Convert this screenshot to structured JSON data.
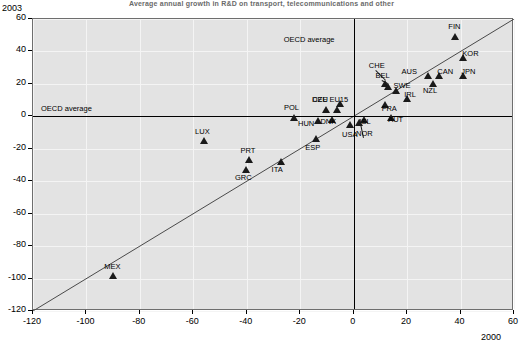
{
  "title": "Average annual growth in R&D on transport, telecommunications and other",
  "axes": {
    "y_corner_label": "2003",
    "x_corner_label": "2000",
    "xlim": [
      -120,
      60
    ],
    "ylim": [
      -120,
      60
    ],
    "xticks": [
      -120,
      -100,
      -80,
      -60,
      -40,
      -20,
      0,
      20,
      40,
      60
    ],
    "yticks": [
      -120,
      -100,
      -80,
      -60,
      -40,
      -20,
      0,
      20,
      40,
      60
    ],
    "grid": true
  },
  "annotations": {
    "oecd_average_horizontal": "OECD average",
    "oecd_average_vertical": "OECD average"
  },
  "chart_data": {
    "type": "scatter",
    "title": "Average annual growth in R&D on transport, telecommunications and other",
    "xlabel": "2000",
    "ylabel": "2003",
    "xlim": [
      -120,
      60
    ],
    "ylim": [
      -120,
      60
    ],
    "grid": true,
    "legend": "none",
    "reference_lines": [
      {
        "name": "diagonal",
        "type": "identity",
        "from": [
          -120,
          -120
        ],
        "to": [
          60,
          60
        ]
      },
      {
        "name": "oecd-average-x",
        "type": "vertical",
        "value": 0
      },
      {
        "name": "oecd-average-y",
        "type": "horizontal",
        "value": 0
      }
    ],
    "points": [
      {
        "label": "FIN",
        "x": 38,
        "y": 47,
        "label_dx": 0,
        "label_dy": -10,
        "leader": false
      },
      {
        "label": "KOR",
        "x": 41,
        "y": 34,
        "label_dx": 6,
        "label_dy": -4,
        "leader": false
      },
      {
        "label": "AUS",
        "x": 28,
        "y": 23,
        "label_dx": -20,
        "label_dy": -4,
        "leader": false
      },
      {
        "label": "CAN",
        "x": 32,
        "y": 23,
        "label_dx": 5,
        "label_dy": -4,
        "leader": false
      },
      {
        "label": "JPN",
        "x": 41,
        "y": 23,
        "label_dx": 5,
        "label_dy": -4,
        "leader": false
      },
      {
        "label": "NZL",
        "x": 30,
        "y": 18,
        "label_dx": -4,
        "label_dy": 7,
        "leader": false
      },
      {
        "label": "CHE",
        "x": 12,
        "y": 18,
        "label_dx": -10,
        "label_dy": -18,
        "leader": true
      },
      {
        "label": "BEL",
        "x": 13,
        "y": 16,
        "label_dx": -6,
        "label_dy": -11,
        "leader": true
      },
      {
        "label": "SWE",
        "x": 16,
        "y": 14,
        "label_dx": 4,
        "label_dy": -5,
        "leader": false
      },
      {
        "label": "IRL",
        "x": 20,
        "y": 9,
        "label_dx": 4,
        "label_dy": -4,
        "leader": false
      },
      {
        "label": "FRA",
        "x": 12,
        "y": 5,
        "label_dx": 3,
        "label_dy": 4,
        "leader": false
      },
      {
        "label": "CZE",
        "x": -5,
        "y": 6,
        "label_dx": -21,
        "label_dy": -4,
        "leader": false
      },
      {
        "label": "DEU",
        "x": -10,
        "y": 2,
        "label_dx": -8,
        "label_dy": -10,
        "leader": false
      },
      {
        "label": "EU15",
        "x": -6,
        "y": 2,
        "label_dx": 1,
        "label_dy": -10,
        "leader": false
      },
      {
        "label": "POL",
        "x": -22,
        "y": -3,
        "label_dx": -4,
        "label_dy": -10,
        "leader": false
      },
      {
        "label": "HUN",
        "x": -13,
        "y": -5,
        "label_dx": -14,
        "label_dy": 3,
        "leader": false
      },
      {
        "label": "DNK",
        "x": -8,
        "y": -4,
        "label_dx": -5,
        "label_dy": 2,
        "leader": false
      },
      {
        "label": "ISL",
        "x": 4,
        "y": -4,
        "label_dx": 2,
        "label_dy": 2,
        "leader": false
      },
      {
        "label": "AUT",
        "x": 14,
        "y": -3,
        "label_dx": 4,
        "label_dy": 2,
        "leader": false
      },
      {
        "label": "NOR",
        "x": 2,
        "y": -6,
        "label_dx": 4,
        "label_dy": 11,
        "leader": true
      },
      {
        "label": "USA",
        "x": -1,
        "y": -7,
        "label_dx": -2,
        "label_dy": 10,
        "leader": false
      },
      {
        "label": "ESP",
        "x": -14,
        "y": -16,
        "label_dx": -4,
        "label_dy": 9,
        "leader": false
      },
      {
        "label": "LUX",
        "x": -56,
        "y": -17,
        "label_dx": -2,
        "label_dy": -9,
        "leader": false
      },
      {
        "label": "ITA",
        "x": -27,
        "y": -30,
        "label_dx": -3,
        "label_dy": 8,
        "leader": false
      },
      {
        "label": "PRT",
        "x": -39,
        "y": -29,
        "label_dx": -2,
        "label_dy": -9,
        "leader": false
      },
      {
        "label": "GRC",
        "x": -40,
        "y": -35,
        "label_dx": -5,
        "label_dy": 8,
        "leader": false
      },
      {
        "label": "MEX",
        "x": -90,
        "y": -100,
        "label_dx": -2,
        "label_dy": -9,
        "leader": false
      }
    ]
  }
}
